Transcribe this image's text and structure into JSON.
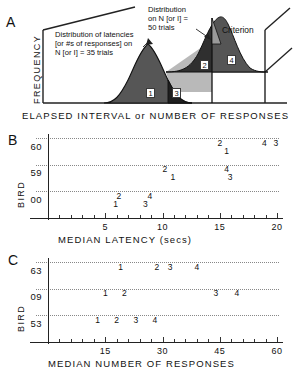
{
  "figure": {
    "panels": [
      "A",
      "B",
      "C"
    ]
  },
  "panelA": {
    "letter": "A",
    "ylabel": "FREQUENCY",
    "xlabel": "ELAPSED INTERVAL or NUMBER OF RESPONSES",
    "annotation_left": "Distribution of latencies\n[or #s of responses] on\nN [or I] = 35 trials",
    "annotation_right": "Distribution\non N [or I] =\n50 trials",
    "criterion_label": "Criterion",
    "region_labels": [
      "1",
      "2",
      "3",
      "4"
    ],
    "colors": {
      "curve_dark": "#4d4d4d",
      "curve_darker": "#2b2b2b",
      "overlap_light": "#b3b3b3",
      "outline": "#1a1a1a"
    }
  },
  "chart_data": [
    {
      "type": "scatter",
      "panel": "A",
      "title": "",
      "xlabel": "ELAPSED INTERVAL or NUMBER OF RESPONSES",
      "ylabel": "FREQUENCY",
      "description": "Two overlapping normal distributions with a criterion cutoff; four numbered outcome regions.",
      "distributions": [
        {
          "name": "N [or I] = 35 trials",
          "mean_px": 150,
          "sd_px": 22,
          "peak_height_px": 62
        },
        {
          "name": "N [or I] = 50 trials",
          "mean_px": 222,
          "sd_px": 20,
          "peak_height_px": 58
        }
      ],
      "criterion_x_px": 212,
      "regions": [
        "1",
        "2",
        "3",
        "4"
      ]
    },
    {
      "type": "scatter",
      "panel": "B",
      "title": "",
      "xlabel": "MEDIAN LATENCY (secs)",
      "ylabel": "BIRD",
      "xlim": [
        0,
        20
      ],
      "xticks": [
        5,
        10,
        15,
        20
      ],
      "xtick_labels": [
        "5",
        "10",
        "15",
        "20"
      ],
      "xminor_step": 1,
      "categories": [
        "60",
        "59",
        "00"
      ],
      "grid": "dotted-horizontal",
      "point_labels": [
        "1",
        "2",
        "3",
        "4"
      ],
      "series": [
        {
          "name": "60",
          "points": [
            {
              "label": "2",
              "x": 15.0,
              "sub": 0
            },
            {
              "label": "1",
              "x": 15.6,
              "sub": 1
            },
            {
              "label": "4",
              "x": 18.9,
              "sub": 0
            },
            {
              "label": "3",
              "x": 19.9,
              "sub": 0
            }
          ]
        },
        {
          "name": "59",
          "points": [
            {
              "label": "2",
              "x": 10.2,
              "sub": 0
            },
            {
              "label": "1",
              "x": 10.9,
              "sub": 1
            },
            {
              "label": "4",
              "x": 15.6,
              "sub": 0
            },
            {
              "label": "3",
              "x": 15.9,
              "sub": 1
            }
          ]
        },
        {
          "name": "00",
          "points": [
            {
              "label": "2",
              "x": 6.2,
              "sub": 0
            },
            {
              "label": "1",
              "x": 5.9,
              "sub": 1
            },
            {
              "label": "4",
              "x": 8.9,
              "sub": 0
            },
            {
              "label": "3",
              "x": 8.5,
              "sub": 1
            }
          ]
        }
      ]
    },
    {
      "type": "scatter",
      "panel": "C",
      "title": "",
      "xlabel": "MEDIAN NUMBER OF RESPONSES",
      "ylabel": "BIRD",
      "xlim": [
        0,
        60
      ],
      "xticks": [
        15,
        30,
        45,
        60
      ],
      "xtick_labels": [
        "15",
        "30",
        "45",
        "60"
      ],
      "xminor_step": 3,
      "categories": [
        "63",
        "09",
        "53"
      ],
      "grid": "dotted-horizontal",
      "point_labels": [
        "1",
        "2",
        "3",
        "4"
      ],
      "series": [
        {
          "name": "63",
          "points": [
            {
              "label": "1",
              "x": 19.0,
              "sub": 0
            },
            {
              "label": "2",
              "x": 28.5,
              "sub": 0
            },
            {
              "label": "3",
              "x": 32.0,
              "sub": 0
            },
            {
              "label": "4",
              "x": 39.0,
              "sub": 0
            }
          ]
        },
        {
          "name": "09",
          "points": [
            {
              "label": "1",
              "x": 15.0,
              "sub": 0
            },
            {
              "label": "2",
              "x": 20.0,
              "sub": 0
            },
            {
              "label": "3",
              "x": 44.0,
              "sub": 0
            },
            {
              "label": "4",
              "x": 49.5,
              "sub": 0
            }
          ]
        },
        {
          "name": "53",
          "points": [
            {
              "label": "1",
              "x": 13.0,
              "sub": 0
            },
            {
              "label": "2",
              "x": 18.0,
              "sub": 0
            },
            {
              "label": "3",
              "x": 23.0,
              "sub": 0
            },
            {
              "label": "4",
              "x": 28.0,
              "sub": 0
            }
          ]
        }
      ]
    }
  ],
  "panelB": {
    "letter": "B",
    "ylabel": "BIRD",
    "xlabel": "MEDIAN LATENCY (secs)"
  },
  "panelC": {
    "letter": "C",
    "ylabel": "BIRD",
    "xlabel": "MEDIAN NUMBER OF RESPONSES"
  }
}
